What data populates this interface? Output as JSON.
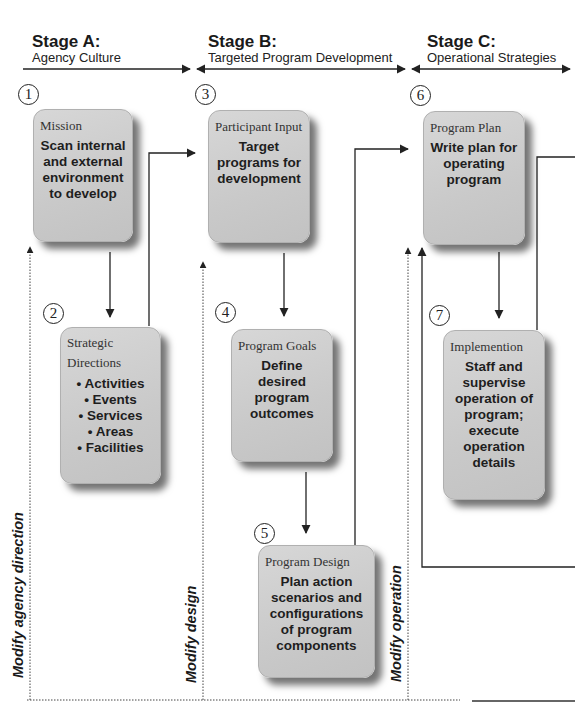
{
  "stages": [
    {
      "title": "Stage A:",
      "subtitle": "Agency Culture"
    },
    {
      "title": "Stage B:",
      "subtitle": "Targeted Program Development"
    },
    {
      "title": "Stage C:",
      "subtitle": "Operational Strategies"
    }
  ],
  "steps": [
    {
      "number": "1",
      "label": "Mission",
      "body": "Scan internal and external environment to develop"
    },
    {
      "number": "2",
      "label": "Strategic Directions",
      "label_line1": "Strategic",
      "label_line2": "Directions",
      "bullets": [
        "• Activities",
        "• Events",
        "• Services",
        "• Areas",
        "• Facilities"
      ]
    },
    {
      "number": "3",
      "label": "Participant Input",
      "body": "Target programs for development"
    },
    {
      "number": "4",
      "label": "Program Goals",
      "body": "Define desired program outcomes"
    },
    {
      "number": "5",
      "label": "Program Design",
      "body": "Plan action scenarios and configurations of program components"
    },
    {
      "number": "6",
      "label": "Program Plan",
      "body": "Write plan for operating program"
    },
    {
      "number": "7",
      "label": "Implemention",
      "body": "Staff and supervise operation of program; execute operation details"
    }
  ],
  "feedback_labels": {
    "agency": "Modify agency direction",
    "design": "Modify design",
    "operation": "Modify operation"
  },
  "colors": {
    "box_fill": "#cacaca",
    "line": "#333333",
    "background": "#ffffff"
  }
}
